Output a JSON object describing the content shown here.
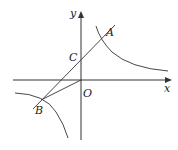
{
  "diagram": {
    "type": "coordinate-geometry",
    "labels": {
      "x_axis": "x",
      "y_axis": "y",
      "origin": "O",
      "point_a": "A",
      "point_b": "B",
      "point_c": "C"
    },
    "colors": {
      "stroke": "#333333",
      "background": "#ffffff"
    }
  }
}
